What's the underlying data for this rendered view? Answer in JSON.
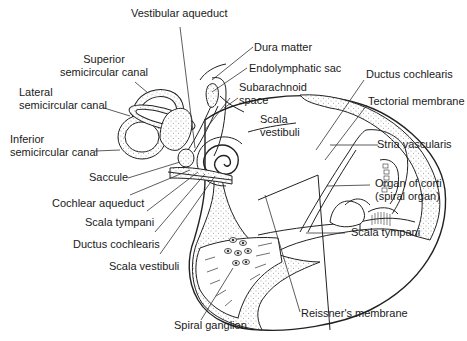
{
  "figure": {
    "labels": {
      "vestibular_aqueduct": "Vestibular aqueduct",
      "dura_matter": "Dura matter",
      "endolymphatic_sac": "Endolymphatic sac",
      "subarachnoid_space_1": "Subarachnoid",
      "subarachnoid_space_2": "space",
      "superior_canal_1": "Superior",
      "superior_canal_2": "semicircular canal",
      "lateral_canal_1": "Lateral",
      "lateral_canal_2": "semicircular canal",
      "inferior_canal_1": "Inferior",
      "inferior_canal_2": "semicircular canal",
      "saccule": "Saccule",
      "cochlear_aqueduct": "Cochlear aqueduct",
      "scala_tympani_left": "Scala tympani",
      "ductus_cochlearis_left": "Ductus cochlearis",
      "scala_vestibuli_left": "Scala vestibuli",
      "scala_vestibuli_inner_1": "Scala",
      "scala_vestibuli_inner_2": "vestibuli",
      "ductus_cochlearis_right": "Ductus cochlearis",
      "tectorial_membrane": "Tectorial membrane",
      "stria_vascularis": "Stria vascularis",
      "organ_of_corti_1": "Organ of corti",
      "organ_of_corti_2": "(spiral organ)",
      "scala_tympani_right": "Scala tympani",
      "reissners_membrane": "Reissner's membrane",
      "spiral_ganglion": "Spiral ganglion"
    }
  }
}
